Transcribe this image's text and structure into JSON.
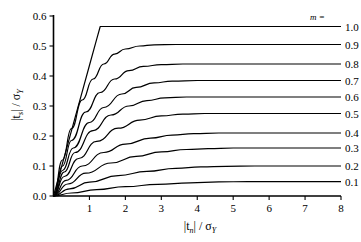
{
  "chart_data": {
    "type": "line",
    "title": "",
    "xlabel": "|t_n| / σ_Y",
    "ylabel": "|t_s| / σ_Y",
    "xlim": [
      0,
      8
    ],
    "ylim": [
      0,
      0.6
    ],
    "xticks": [
      "1",
      "2",
      "3",
      "4",
      "5",
      "6",
      "7",
      "8"
    ],
    "xtick_values": [
      1,
      2,
      3,
      4,
      5,
      6,
      7,
      8
    ],
    "yticks": [
      "0.0",
      "0.1",
      "0.2",
      "0.3",
      "0.4",
      "0.5",
      "0.6"
    ],
    "ytick_values": [
      0.0,
      0.1,
      0.2,
      0.3,
      0.4,
      0.5,
      0.6
    ],
    "grid": false,
    "legend_position": "right-outside",
    "legend_title": "m =",
    "series": [
      {
        "name": "1.0",
        "plateau": 0.565,
        "knee_x": 1.3,
        "sharpness": 40,
        "points": [
          [
            0,
            0
          ],
          [
            0.2,
            0.087
          ],
          [
            0.4,
            0.174
          ],
          [
            0.6,
            0.261
          ],
          [
            0.8,
            0.348
          ],
          [
            1.0,
            0.435
          ],
          [
            1.2,
            0.522
          ],
          [
            1.3,
            0.565
          ],
          [
            1.6,
            0.565
          ],
          [
            2.0,
            0.565
          ],
          [
            3.0,
            0.565
          ],
          [
            4.0,
            0.565
          ],
          [
            5.0,
            0.565
          ],
          [
            6.0,
            0.565
          ],
          [
            7.0,
            0.565
          ],
          [
            8.0,
            0.565
          ]
        ]
      },
      {
        "name": "0.9",
        "plateau": 0.505,
        "knee_x": 2.1,
        "sharpness": 3.2,
        "points": [
          [
            0,
            0
          ],
          [
            0.25,
            0.12
          ],
          [
            0.5,
            0.225
          ],
          [
            0.8,
            0.32
          ],
          [
            1.1,
            0.39
          ],
          [
            1.4,
            0.44
          ],
          [
            1.7,
            0.473
          ],
          [
            2.0,
            0.49
          ],
          [
            2.4,
            0.5
          ],
          [
            2.8,
            0.504
          ],
          [
            3.4,
            0.505
          ],
          [
            4.5,
            0.505
          ],
          [
            6.0,
            0.505
          ],
          [
            8.0,
            0.505
          ]
        ]
      },
      {
        "name": "0.8",
        "plateau": 0.44,
        "knee_x": 2.3,
        "sharpness": 2.8,
        "points": [
          [
            0,
            0
          ],
          [
            0.25,
            0.1
          ],
          [
            0.5,
            0.185
          ],
          [
            0.9,
            0.28
          ],
          [
            1.3,
            0.345
          ],
          [
            1.7,
            0.39
          ],
          [
            2.1,
            0.418
          ],
          [
            2.5,
            0.432
          ],
          [
            3.0,
            0.438
          ],
          [
            3.6,
            0.44
          ],
          [
            4.5,
            0.44
          ],
          [
            6.0,
            0.44
          ],
          [
            8.0,
            0.44
          ]
        ]
      },
      {
        "name": "0.7",
        "plateau": 0.385,
        "knee_x": 2.5,
        "sharpness": 2.5,
        "points": [
          [
            0,
            0
          ],
          [
            0.25,
            0.085
          ],
          [
            0.55,
            0.16
          ],
          [
            1.0,
            0.245
          ],
          [
            1.4,
            0.295
          ],
          [
            1.9,
            0.34
          ],
          [
            2.3,
            0.362
          ],
          [
            2.8,
            0.377
          ],
          [
            3.3,
            0.383
          ],
          [
            4.0,
            0.385
          ],
          [
            5.0,
            0.385
          ],
          [
            6.5,
            0.385
          ],
          [
            8.0,
            0.385
          ]
        ]
      },
      {
        "name": "0.6",
        "plateau": 0.33,
        "knee_x": 2.7,
        "sharpness": 2.2,
        "points": [
          [
            0,
            0
          ],
          [
            0.3,
            0.08
          ],
          [
            0.6,
            0.145
          ],
          [
            1.1,
            0.218
          ],
          [
            1.6,
            0.27
          ],
          [
            2.1,
            0.3
          ],
          [
            2.6,
            0.318
          ],
          [
            3.1,
            0.327
          ],
          [
            3.7,
            0.33
          ],
          [
            4.5,
            0.33
          ],
          [
            6.0,
            0.33
          ],
          [
            8.0,
            0.33
          ]
        ]
      },
      {
        "name": "0.5",
        "plateau": 0.275,
        "knee_x": 3.0,
        "sharpness": 2.0,
        "points": [
          [
            0,
            0
          ],
          [
            0.3,
            0.065
          ],
          [
            0.7,
            0.125
          ],
          [
            1.2,
            0.182
          ],
          [
            1.8,
            0.226
          ],
          [
            2.4,
            0.253
          ],
          [
            3.0,
            0.267
          ],
          [
            3.6,
            0.273
          ],
          [
            4.2,
            0.275
          ],
          [
            5.2,
            0.275
          ],
          [
            6.5,
            0.275
          ],
          [
            8.0,
            0.275
          ]
        ]
      },
      {
        "name": "0.4",
        "plateau": 0.21,
        "knee_x": 3.2,
        "sharpness": 1.8,
        "points": [
          [
            0,
            0
          ],
          [
            0.35,
            0.052
          ],
          [
            0.8,
            0.1
          ],
          [
            1.4,
            0.145
          ],
          [
            2.0,
            0.173
          ],
          [
            2.7,
            0.193
          ],
          [
            3.3,
            0.203
          ],
          [
            3.9,
            0.208
          ],
          [
            4.6,
            0.21
          ],
          [
            5.6,
            0.21
          ],
          [
            7.0,
            0.21
          ],
          [
            8.0,
            0.21
          ]
        ]
      },
      {
        "name": "0.3",
        "plateau": 0.16,
        "knee_x": 3.5,
        "sharpness": 1.6,
        "points": [
          [
            0,
            0
          ],
          [
            0.4,
            0.04
          ],
          [
            0.9,
            0.076
          ],
          [
            1.6,
            0.11
          ],
          [
            2.3,
            0.132
          ],
          [
            3.0,
            0.147
          ],
          [
            3.7,
            0.155
          ],
          [
            4.3,
            0.158
          ],
          [
            5.0,
            0.16
          ],
          [
            6.0,
            0.16
          ],
          [
            7.0,
            0.16
          ],
          [
            8.0,
            0.16
          ]
        ]
      },
      {
        "name": "0.2",
        "plateau": 0.1,
        "knee_x": 3.7,
        "sharpness": 1.4,
        "points": [
          [
            0,
            0
          ],
          [
            0.45,
            0.024
          ],
          [
            1.0,
            0.046
          ],
          [
            1.8,
            0.068
          ],
          [
            2.6,
            0.082
          ],
          [
            3.4,
            0.092
          ],
          [
            4.1,
            0.097
          ],
          [
            4.8,
            0.099
          ],
          [
            5.6,
            0.1
          ],
          [
            6.6,
            0.1
          ],
          [
            8.0,
            0.1
          ]
        ]
      },
      {
        "name": "0.1",
        "plateau": 0.048,
        "knee_x": 4.0,
        "sharpness": 1.2,
        "points": [
          [
            0,
            0
          ],
          [
            0.5,
            0.01
          ],
          [
            1.2,
            0.021
          ],
          [
            2.0,
            0.031
          ],
          [
            2.9,
            0.039
          ],
          [
            3.8,
            0.044
          ],
          [
            4.6,
            0.047
          ],
          [
            5.4,
            0.048
          ],
          [
            6.4,
            0.048
          ],
          [
            8.0,
            0.048
          ]
        ]
      }
    ]
  },
  "axis": {
    "y_title_main": "|t",
    "y_title_sub": "s",
    "y_title_rest": "| / σ",
    "y_title_sub2": "Y",
    "x_title_main": "|t",
    "x_title_sub": "n",
    "x_title_rest": "| / σ",
    "x_title_sub2": "Y"
  },
  "legend": {
    "title": "m ="
  }
}
